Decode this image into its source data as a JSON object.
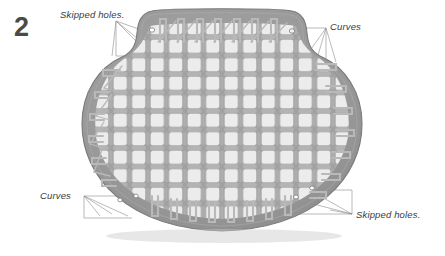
{
  "figure": {
    "step_number": "2",
    "title_alt": "Caned chair seat weaving diagram step 2",
    "colors": {
      "frame_gray": "#9a9a9a",
      "frame_edge": "#7d7d7d",
      "cane_gray": "#b4b4b4",
      "cane_shade": "#8e8e8e",
      "hole_white": "#fbfbfb",
      "leader_line": "#8c8c8c",
      "label_text": "#3a3a3a",
      "step_number": "#4a4a4a",
      "background": "#ffffff"
    }
  },
  "annotations": [
    {
      "id": "skipped-top-left",
      "text": "Skipped holes.",
      "position": "top-left"
    },
    {
      "id": "curves-top-right",
      "text": "Curves",
      "position": "top-right"
    },
    {
      "id": "curves-bottom-left",
      "text": "Curves",
      "position": "bottom-left"
    },
    {
      "id": "skipped-bottom-right",
      "text": "Skipped holes.",
      "position": "bottom-right"
    }
  ],
  "weave": {
    "grid_columns": 13,
    "grid_rows": 11,
    "hole_shape": "octagonal",
    "pattern": "seven-step cane weave with diagonals"
  }
}
